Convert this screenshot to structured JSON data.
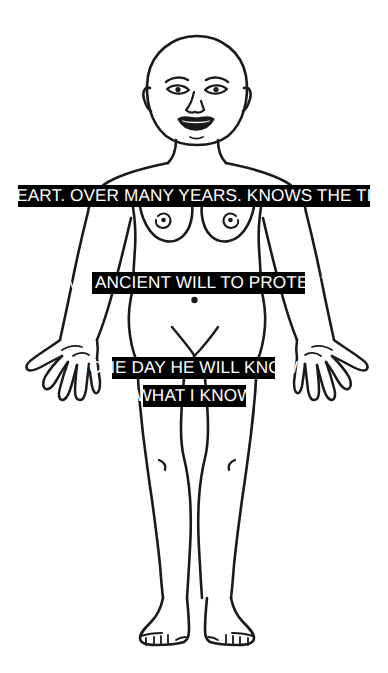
{
  "artwork": {
    "title": "Anatomical figure with text banners",
    "background_color": "#ffffff",
    "line_color": "#1a1a1a",
    "banner_background_color": "#000000",
    "banner_text_color": "#ffffff",
    "figure_description": "front-facing line-drawn nude female body, bald head, arms at sides, feet together"
  },
  "banners": [
    {
      "id": "banner-1",
      "text": "MY HEART. OVER MANY YEARS. KNOWS THE TRUTH"
    },
    {
      "id": "banner-2",
      "text": "MY ANCIENT WILL TO PROTECT"
    },
    {
      "id": "banner-3",
      "text": "ONE DAY HE WILL KNOW"
    },
    {
      "id": "banner-4",
      "text": "WHAT I KNOW"
    }
  ],
  "figure_parts": {
    "head": "head-outline",
    "face": "face-features",
    "neck": "neck",
    "torso": "torso-outline",
    "breasts": "breasts",
    "navel": "navel",
    "pubis": "pubic-marking",
    "left_arm": "left-arm",
    "right_arm": "right-arm",
    "left_hand": "left-hand",
    "right_hand": "right-hand",
    "legs": "legs",
    "knees": "knee-marks",
    "feet": "feet"
  }
}
